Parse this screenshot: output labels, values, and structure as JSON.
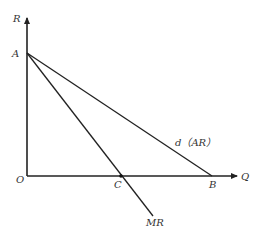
{
  "diagram": {
    "type": "monopoly-revenue-curves",
    "axes": {
      "y_label": "R",
      "x_label": "Q",
      "origin_label": "O"
    },
    "points": {
      "A": {
        "label": "A",
        "x": 27,
        "y": 53
      },
      "B": {
        "label": "B",
        "x": 212,
        "y": 176
      },
      "C": {
        "label": "C",
        "x": 121,
        "y": 176
      }
    },
    "curves": [
      {
        "name": "demand-average-revenue",
        "label": "d（AR）",
        "from": "A",
        "to": "B"
      },
      {
        "name": "marginal-revenue",
        "label": "MR",
        "from": "A",
        "through": "C"
      }
    ],
    "colors": {
      "line": "#222222",
      "text": "#333333",
      "background": "#ffffff"
    }
  }
}
